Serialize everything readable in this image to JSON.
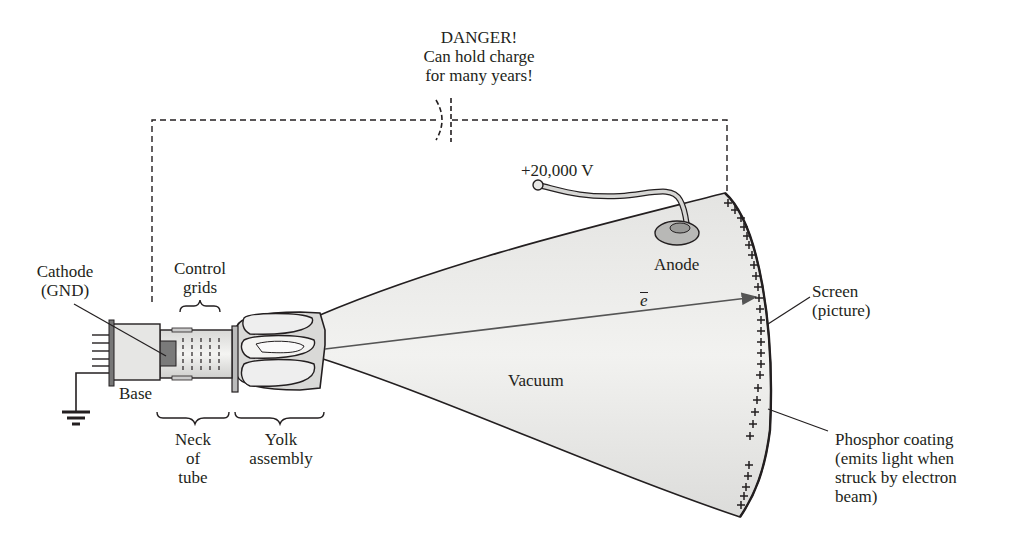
{
  "diagram": {
    "colors": {
      "ink": "#231f20",
      "tube_fill": "#ececea",
      "tube_shade": "#d6d6d4",
      "cathode_fill": "#7a7a7a",
      "anode_fill": "#b8b8b6"
    },
    "warning": {
      "line1": "DANGER!",
      "line2": "Can hold charge",
      "line3": "for many years!"
    },
    "labels": {
      "voltage": "+20,000 V",
      "anode": "Anode",
      "electron": "e",
      "vacuum": "Vacuum",
      "cathode_l1": "Cathode",
      "cathode_l2": "(GND)",
      "control_l1": "Control",
      "control_l2": "grids",
      "base": "Base",
      "neck_l1": "Neck",
      "neck_l2": "of",
      "neck_l3": "tube",
      "yolk_l1": "Yolk",
      "yolk_l2": "assembly",
      "screen_l1": "Screen",
      "screen_l2": "(picture)",
      "phosphor_l1": "Phosphor coating",
      "phosphor_l2": "(emits light when",
      "phosphor_l3": "struck by electron",
      "phosphor_l4": "beam)"
    },
    "screen_charge_symbol": "+",
    "screen_charge_count": 26
  }
}
